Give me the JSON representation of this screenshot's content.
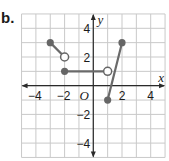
{
  "part_label": "b.",
  "axes": {
    "x_name": "x",
    "y_name": "y",
    "origin_label": "O",
    "x_ticks": [
      {
        "value": -4,
        "label": "−4"
      },
      {
        "value": -2,
        "label": "−2"
      },
      {
        "value": 2,
        "label": "2"
      },
      {
        "value": 4,
        "label": "4"
      }
    ],
    "y_ticks": [
      {
        "value": 4,
        "label": "4"
      },
      {
        "value": 2,
        "label": "2"
      },
      {
        "value": -2,
        "label": "−2"
      },
      {
        "value": -4,
        "label": "−4"
      }
    ],
    "xlim": [
      -5,
      5
    ],
    "ylim": [
      -5,
      5
    ]
  },
  "colors": {
    "grid": "#c9c9c9",
    "axis": "#2a2a2a",
    "segment": "#6a6a6a",
    "point": "#666666",
    "open_fill": "#ffffff"
  },
  "chart_data": {
    "type": "line",
    "title": "",
    "xlabel": "x",
    "ylabel": "y",
    "xlim": [
      -5,
      5
    ],
    "ylim": [
      -5,
      5
    ],
    "grid": true,
    "segments": [
      {
        "from": {
          "x": -3,
          "y": 3,
          "closed": true
        },
        "to": {
          "x": -2,
          "y": 2,
          "closed": false
        }
      },
      {
        "from": {
          "x": -2,
          "y": 1,
          "closed": true
        },
        "to": {
          "x": 1,
          "y": 1,
          "closed": false
        }
      },
      {
        "from": {
          "x": 1,
          "y": -1,
          "closed": true
        },
        "to": {
          "x": 2,
          "y": 3,
          "closed": true
        }
      }
    ]
  }
}
